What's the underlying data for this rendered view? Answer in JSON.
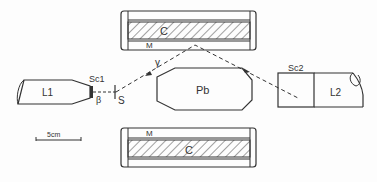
{
  "diagram": {
    "labels": {
      "top_converter": "C",
      "top_moderator": "M",
      "bottom_converter": "C",
      "bottom_moderator": "M",
      "lead_block": "Pb",
      "left_detector": "L1",
      "right_detector": "L2",
      "scintillator_1": "Sc1",
      "scintillator_2": "Sc2",
      "source": "S",
      "beta": "β",
      "gamma": "γ",
      "scale_bar": "5cm"
    },
    "colors": {
      "line": "#333333",
      "background": "#fdfdfd"
    }
  }
}
